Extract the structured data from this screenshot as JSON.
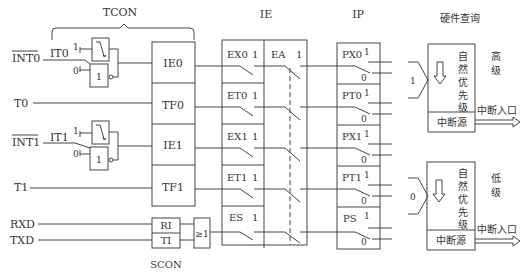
{
  "title_labels": {
    "tcon": "TCON",
    "ie": "IE",
    "ip": "IP",
    "hardware_poll": "硬件查询",
    "scon": "SCON"
  },
  "inputs": [
    {
      "name": "INT0",
      "overline": true
    },
    {
      "name": "T0"
    },
    {
      "name": "INT1",
      "overline": true
    },
    {
      "name": "T1"
    },
    {
      "name": "RXD"
    },
    {
      "name": "TXD"
    }
  ],
  "trigger_select": [
    {
      "label": "IT0",
      "one": "1",
      "zero": "0",
      "gate": "1"
    },
    {
      "label": "IT1",
      "one": "1",
      "zero": "0",
      "gate": "1"
    }
  ],
  "tcon_flags": [
    "IE0",
    "TF0",
    "IE1",
    "TF1"
  ],
  "scon_flags": [
    "RI",
    "TI"
  ],
  "or_gate": "≥1",
  "ie_bits": [
    {
      "name": "EX0",
      "value": "1"
    },
    {
      "name": "ET0",
      "value": "1"
    },
    {
      "name": "EX1",
      "value": "1"
    },
    {
      "name": "ET1",
      "value": "1"
    },
    {
      "name": "ES",
      "value": "1"
    }
  ],
  "ea": {
    "name": "EA",
    "value": "1"
  },
  "ip_bits": [
    {
      "name": "PX0",
      "one": "1",
      "zero": "0"
    },
    {
      "name": "PT0",
      "one": "1",
      "zero": "0"
    },
    {
      "name": "PX1",
      "one": "1",
      "zero": "0"
    },
    {
      "name": "PT1",
      "one": "1",
      "zero": "0"
    },
    {
      "name": "PS",
      "one": "1",
      "zero": "0"
    }
  ],
  "priority_blocks": [
    {
      "input_value": "1",
      "natural_priority": [
        "自",
        "然",
        "优",
        "先",
        "级"
      ],
      "source": "中断源",
      "level": [
        "高",
        "级"
      ],
      "exit": "中断入口"
    },
    {
      "input_value": "0",
      "natural_priority": [
        "自",
        "然",
        "优",
        "先",
        "级"
      ],
      "source": "中断源",
      "level": [
        "低",
        "级"
      ],
      "exit": "中断入口"
    }
  ]
}
